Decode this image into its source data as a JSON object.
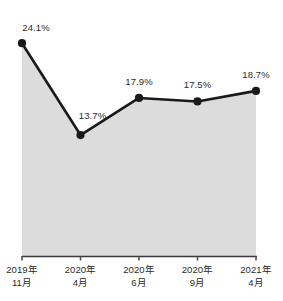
{
  "chart_data": {
    "type": "line",
    "title": "",
    "subtitle": "",
    "xlabel": "",
    "ylabel": "",
    "grid": false,
    "legend": "none",
    "fill_under": true,
    "categories": [
      "2019年\n11月",
      "2020年\n4月",
      "2020年\n6月",
      "2020年\n9月",
      "2021年\n4月"
    ],
    "category_lines": [
      {
        "top": "2019年",
        "bottom": "11月"
      },
      {
        "top": "2020年",
        "bottom": "4月"
      },
      {
        "top": "2020年",
        "bottom": "6月"
      },
      {
        "top": "2020年",
        "bottom": "9月"
      },
      {
        "top": "2021年",
        "bottom": "4月"
      }
    ],
    "values": [
      24.1,
      13.7,
      17.9,
      17.5,
      18.7
    ],
    "point_labels": [
      "24.1%",
      "13.7%",
      "17.9%",
      "17.5%",
      "18.7%"
    ],
    "ylim": [
      0,
      26.5
    ],
    "series": [
      {
        "name": "",
        "values": [
          24.1,
          13.7,
          17.9,
          17.5,
          18.7
        ]
      }
    ],
    "colors": {
      "line": "#1a1a1a",
      "marker": "#1a1a1a",
      "area_fill": "#dcdcdc",
      "axis": "#4a4a4a",
      "text": "#2a2a2a",
      "background": "#ffffff"
    }
  }
}
